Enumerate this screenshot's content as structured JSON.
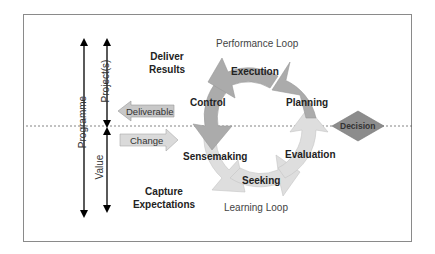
{
  "diagram": {
    "title": "",
    "axes": {
      "programme": "Programme",
      "projects": "Project(s)",
      "value": "Value"
    },
    "zones": {
      "top": [
        "Deliver",
        "Results"
      ],
      "bottom": [
        "Capture",
        "Expectations"
      ]
    },
    "loops": {
      "top": "Performance Loop",
      "bottom": "Learning Loop"
    },
    "stages": {
      "execution": "Execution",
      "planning": "Planning",
      "control": "Control",
      "sensemaking": "Sensemaking",
      "seeking": "Seeking",
      "evaluation": "Evaluation"
    },
    "arrows": {
      "deliverable": "Deliverable",
      "change": "Change"
    },
    "decision": "Decision",
    "colors": {
      "performance_loop": "#a9a9a9",
      "learning_loop": "#dedede",
      "decision": "#8c8c8c",
      "arrow_box": "#c8c8c8",
      "frame": "#8a8a8a"
    }
  }
}
